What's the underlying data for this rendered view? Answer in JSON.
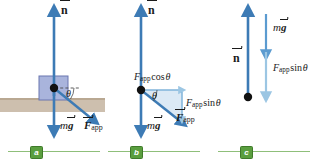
{
  "figure": {
    "colors": {
      "arrow_dark": "#3d7bb5",
      "arrow_mid": "#5b9bd0",
      "arrow_light": "#9cc6e3",
      "block_fill": "#a9b4dc",
      "block_stroke": "#6a76b0",
      "ground_fill": "#cdbfae",
      "triangle_fill": "#cfe2f2",
      "badge_green": "#5a9e3f",
      "rule_green": "#8fbf7a",
      "dot_black": "#111111"
    }
  },
  "panels": [
    {
      "id": "a",
      "badge": "a",
      "labels": {
        "normal": "n",
        "weight_m": "m",
        "weight_g": "g",
        "applied_F": "F",
        "applied_sub": "app",
        "angle": "θ"
      }
    },
    {
      "id": "b",
      "badge": "b",
      "labels": {
        "normal": "n",
        "weight_m": "m",
        "weight_g": "g",
        "applied_F": "F",
        "applied_sub": "app",
        "angle": "θ",
        "horizontal_F": "F",
        "horizontal_sub": "app",
        "horizontal_fn": "cos",
        "horizontal_angle": "θ",
        "vertical_F": "F",
        "vertical_sub": "app",
        "vertical_fn": "sin",
        "vertical_angle": "θ"
      }
    },
    {
      "id": "c",
      "badge": "c",
      "labels": {
        "normal": "n",
        "weight_m": "m",
        "weight_g": "g",
        "vertical_F": "F",
        "vertical_sub": "app",
        "vertical_fn": "sin",
        "vertical_angle": "θ"
      }
    }
  ]
}
